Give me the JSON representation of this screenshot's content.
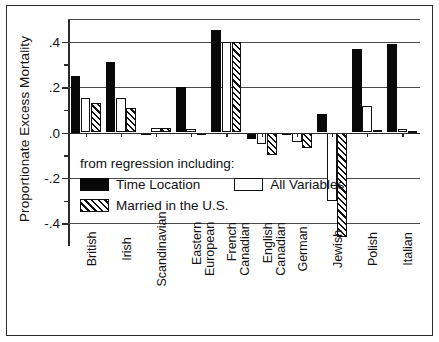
{
  "chart_data": {
    "type": "bar",
    "title": "",
    "xlabel": "",
    "ylabel": "Proportionate Excess Mortality",
    "ylim": [
      -0.5,
      0.5
    ],
    "yticks": [
      ".4",
      ".2",
      ".0",
      "-.2",
      "-.4"
    ],
    "ytick_values": [
      0.4,
      0.2,
      0.0,
      -0.2,
      -0.4
    ],
    "grid": true,
    "legend_position": "inside-lower-left",
    "legend_lead": "from regression including:",
    "categories": [
      "British",
      "Irish",
      "Scandinavian",
      "Eastern European",
      "French Canadian",
      "English Canadian",
      "German",
      "Jewish",
      "Polish",
      "Italian"
    ],
    "category_lines": [
      [
        "British"
      ],
      [
        "Irish"
      ],
      [
        "Scandinavian"
      ],
      [
        "Eastern",
        "European"
      ],
      [
        "French",
        "Canadian"
      ],
      [
        "English",
        "Canadian"
      ],
      [
        "German"
      ],
      [
        "Jewish"
      ],
      [
        "Polish"
      ],
      [
        "Italian"
      ]
    ],
    "series": [
      {
        "name": "Time Location",
        "style": "black",
        "values": [
          0.25,
          0.31,
          -0.01,
          0.2,
          0.45,
          -0.03,
          0.0,
          0.08,
          0.37,
          0.39
        ]
      },
      {
        "name": "All Variables",
        "style": "white",
        "values": [
          0.15,
          0.15,
          0.02,
          0.015,
          0.4,
          -0.05,
          -0.04,
          -0.3,
          0.115,
          0.015
        ]
      },
      {
        "name": "Married in the U.S.",
        "style": "hatched",
        "values": [
          0.13,
          0.11,
          0.02,
          0.0,
          0.4,
          -0.1,
          -0.07,
          -0.46,
          0.01,
          0.005
        ]
      }
    ]
  },
  "axis": {
    "y_title": "Proportionate Excess Mortality"
  },
  "legend": {
    "lead": "from regression including:",
    "items": [
      {
        "label": "Time Location"
      },
      {
        "label": "All Variables"
      },
      {
        "label": "Married in the U.S."
      }
    ]
  }
}
